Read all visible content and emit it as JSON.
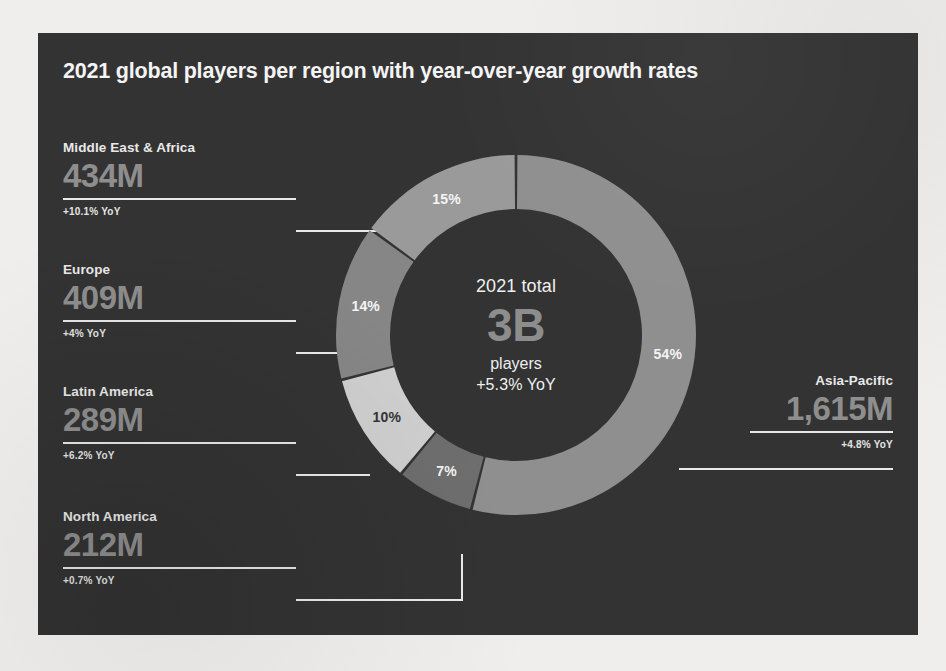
{
  "card": {
    "title": "2021 global players per region with year-over-year growth rates",
    "background_color": "#333333",
    "page_background_color": "#efeeec"
  },
  "center": {
    "caption": "2021 total",
    "total": "3B",
    "unit": "players",
    "yoy": "+5.3% YoY"
  },
  "regions": [
    {
      "key": "middle-east-africa",
      "name": "Middle East & Africa",
      "value": "434M",
      "yoy": "+10.1% YoY",
      "share_label": "15%",
      "color": "#9a9a9a"
    },
    {
      "key": "europe",
      "name": "Europe",
      "value": "409M",
      "yoy": "+4% YoY",
      "share_label": "14%",
      "color": "#868686"
    },
    {
      "key": "latin-america",
      "name": "Latin America",
      "value": "289M",
      "yoy": "+6.2% YoY",
      "share_label": "10%",
      "color": "#cfcfcf"
    },
    {
      "key": "north-america",
      "name": "North America",
      "value": "212M",
      "yoy": "+0.7% YoY",
      "share_label": "7%",
      "color": "#6e6e6e"
    },
    {
      "key": "asia-pacific",
      "name": "Asia-Pacific",
      "value": "1,615M",
      "yoy": "+4.8% YoY",
      "share_label": "54%",
      "color": "#8f8f8f"
    }
  ],
  "chart_data": {
    "type": "pie",
    "title": "2021 global players per region with year-over-year growth rates",
    "subtitle": "",
    "xlabel": "",
    "ylabel": "",
    "donut": true,
    "inner_radius_ratio": 0.7,
    "start_angle_deg": 0,
    "direction": "clockwise",
    "legend": "none",
    "grid": false,
    "value_unit": "millions of players",
    "total_players": "3B",
    "total_yoy_pct": 5.3,
    "categories": [
      "Asia-Pacific",
      "North America",
      "Latin America",
      "Europe",
      "Middle East & Africa"
    ],
    "values": [
      1615,
      212,
      289,
      409,
      434
    ],
    "percentages": [
      54,
      7,
      10,
      14,
      15
    ],
    "yoy_growth_pct": [
      4.8,
      0.7,
      6.2,
      4.0,
      10.1
    ],
    "slice_colors": [
      "#8f8f8f",
      "#6e6e6e",
      "#cfcfcf",
      "#868686",
      "#9a9a9a"
    ],
    "data_labels": [
      "54%",
      "7%",
      "10%",
      "14%",
      "15%"
    ],
    "annotations": [
      "Middle East & Africa 434M +10.1% YoY",
      "Europe 409M +4% YoY",
      "Latin America 289M +6.2% YoY",
      "North America 212M +0.7% YoY",
      "Asia-Pacific 1,615M +4.8% YoY"
    ]
  },
  "slice_label_colors": {
    "on_light": "#333333",
    "on_dark": "#f4f4f4"
  }
}
